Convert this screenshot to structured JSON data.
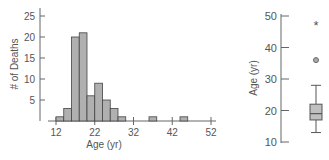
{
  "chart_data": [
    {
      "type": "bar",
      "subtype": "histogram",
      "title": "",
      "xlabel": "Age (yr)",
      "ylabel": "# of Deaths",
      "xlim": [
        12,
        52
      ],
      "ylim": [
        0,
        25
      ],
      "x_ticks": [
        12,
        22,
        32,
        42,
        52
      ],
      "y_ticks": [
        5,
        10,
        15,
        20,
        25
      ],
      "bin_width": 2,
      "bins": [
        {
          "start": 12,
          "end": 14,
          "count": 1
        },
        {
          "start": 14,
          "end": 16,
          "count": 3
        },
        {
          "start": 16,
          "end": 18,
          "count": 20
        },
        {
          "start": 18,
          "end": 20,
          "count": 21
        },
        {
          "start": 20,
          "end": 22,
          "count": 6
        },
        {
          "start": 22,
          "end": 24,
          "count": 9
        },
        {
          "start": 24,
          "end": 26,
          "count": 5
        },
        {
          "start": 26,
          "end": 28,
          "count": 3
        },
        {
          "start": 28,
          "end": 30,
          "count": 1
        },
        {
          "start": 36,
          "end": 38,
          "count": 1
        },
        {
          "start": 44,
          "end": 46,
          "count": 1
        }
      ],
      "grid": false,
      "bar_color": "#b0b0b0"
    },
    {
      "type": "boxplot",
      "title": "",
      "ylabel": "Age (yr)",
      "ylim": [
        10,
        50
      ],
      "y_ticks": [
        10,
        20,
        30,
        40,
        50
      ],
      "whisker_low": 13,
      "q1": 17,
      "median": 19,
      "q3": 22,
      "whisker_high": 28,
      "outliers": [
        {
          "value": 36,
          "marker": "circle"
        }
      ],
      "extreme_outliers": [
        {
          "value": 47,
          "marker": "asterisk"
        }
      ],
      "box_color": "#c0c0c0"
    }
  ],
  "labels": {
    "hist_ylabel": "# of Deaths",
    "hist_xlabel": "Age (yr)",
    "box_ylabel": "Age (yr)",
    "hist_yticks": [
      "25",
      "20",
      "15",
      "10",
      "5"
    ],
    "hist_xticks": [
      "12",
      "22",
      "32",
      "42",
      "52"
    ],
    "box_yticks": [
      "50",
      "40",
      "30",
      "20",
      "10"
    ]
  }
}
